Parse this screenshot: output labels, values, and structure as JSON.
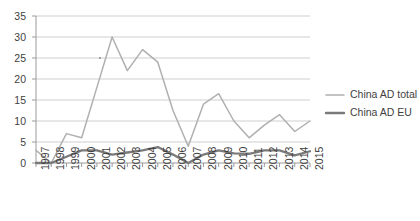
{
  "chart_data": {
    "type": "line",
    "title": "",
    "xlabel": "",
    "ylabel": "",
    "x": [
      1997,
      1998,
      1999,
      2000,
      2001,
      2002,
      2003,
      2004,
      2005,
      2006,
      2007,
      2008,
      2009,
      2010,
      2011,
      2012,
      2013,
      2014,
      2015
    ],
    "categories": [
      "1997",
      "1998",
      "1999",
      "2000",
      "2001",
      "2002",
      "2003",
      "2004",
      "2005",
      "2006",
      "2007",
      "2008",
      "2009",
      "2010",
      "2011",
      "2012",
      "2013",
      "2014",
      "2015"
    ],
    "ylim": [
      0,
      35
    ],
    "yticks": [
      0,
      5,
      10,
      15,
      20,
      25,
      30,
      35
    ],
    "ytick_labels": [
      "0",
      "5",
      "10",
      "15",
      "20",
      "25",
      "30",
      "35"
    ],
    "grid": true,
    "legend_position": "right",
    "series": [
      {
        "name": "China AD total",
        "color": "#b0b0b0",
        "values": [
          3,
          0,
          7,
          6,
          18,
          30,
          22,
          27,
          24,
          12.5,
          4,
          14,
          16.5,
          10,
          6,
          9,
          11.5,
          7.5,
          10
        ]
      },
      {
        "name": "China AD EU",
        "color": "#7a7a7a",
        "values": [
          0,
          0,
          1.5,
          3,
          3,
          2,
          2.5,
          3,
          3.8,
          2,
          0,
          2,
          3,
          2.3,
          2.2,
          3,
          3,
          1.8,
          2.8
        ]
      }
    ]
  },
  "axis": {
    "y_tick_labels": [
      "35",
      "30",
      "25",
      "20",
      "15",
      "10",
      "5",
      "0"
    ],
    "x_tick_labels": [
      "1997",
      "1998",
      "1999",
      "2000",
      "2001",
      "2002",
      "2003",
      "2004",
      "2005",
      "2006",
      "2007",
      "2008",
      "2009",
      "2010",
      "2011",
      "2012",
      "2013",
      "2014",
      "2015"
    ]
  },
  "legend": {
    "items": [
      {
        "label": "China AD total",
        "color": "#b0b0b0"
      },
      {
        "label": "China AD EU",
        "color": "#7a7a7a"
      }
    ]
  },
  "colors": {
    "background": "#ffffff",
    "grid": "#c9c9c9",
    "axis": "#9a9a9a",
    "text": "#3f3f3f",
    "series_total": "#b0b0b0",
    "series_eu": "#7a7a7a"
  }
}
